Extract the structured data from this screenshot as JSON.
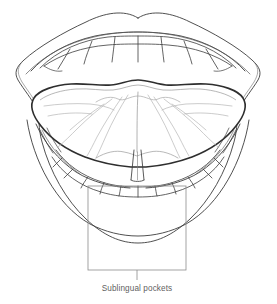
{
  "figure": {
    "title": "Sublingual pockets",
    "view": "anterior intraoral view with tongue elevated",
    "background_color": "#ffffff"
  },
  "callout": {
    "label": "Sublingual pockets",
    "label_color": "#5f5f5f",
    "box_color": "#8c8c8c",
    "leader_color": "#8c8c8c",
    "box": {
      "x": 88,
      "y": 186,
      "width": 98,
      "height": 84
    },
    "leader": {
      "x": 137,
      "y_top": 270,
      "y_bottom": 280
    }
  },
  "structures": {
    "outer_lip": {
      "name": "outer lip border",
      "stroke": "#3c3c3c",
      "stroke_width": 0.9
    },
    "inner_lip": {
      "name": "inner lip border / vermilion",
      "stroke": "#3c3c3c",
      "stroke_width": 0.9
    },
    "upper_teeth": {
      "name": "maxillary teeth",
      "count": 8,
      "stroke": "#3c3c3c",
      "stroke_width": 0.8
    },
    "lower_teeth": {
      "name": "mandibular teeth",
      "count": 10,
      "stroke": "#3c3c3c",
      "stroke_width": 0.8
    },
    "tongue_underside": {
      "name": "ventral surface of tongue",
      "stroke": "#2e2e2e",
      "stroke_width": 1.5
    },
    "lingual_frenulum": {
      "name": "lingual frenulum",
      "stroke": "#3c3c3c",
      "stroke_width": 0.9
    },
    "sublingual_veins": {
      "name": "sublingual veins and plicae",
      "stroke": "#b4b4b4",
      "stroke_width": 0.7
    },
    "floor_of_mouth": {
      "name": "floor of mouth / sublingual pocket region",
      "stroke": "#555555",
      "stroke_width": 0.8
    }
  }
}
